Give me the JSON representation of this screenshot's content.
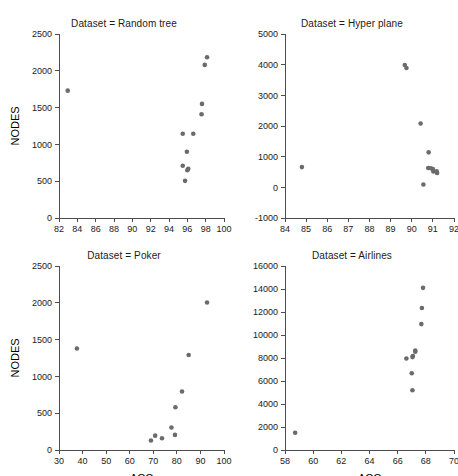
{
  "figure": {
    "background": "#ffffff",
    "marker_color": "#6b6b6b",
    "axis_color": "#4d4d4d",
    "layout": "2x2 grid of scatter panels"
  },
  "chart_data": [
    {
      "type": "scatter",
      "title": "Dataset = Random tree",
      "xlabel": "",
      "ylabel": "NODES",
      "xlim": [
        82,
        100
      ],
      "ylim": [
        0,
        2500
      ],
      "xticks": [
        82,
        84,
        86,
        88,
        90,
        92,
        94,
        96,
        98,
        100
      ],
      "yticks": [
        0,
        500,
        1000,
        1500,
        2000,
        2500
      ],
      "grid": false,
      "legend": "none",
      "points": [
        {
          "x": 82.95,
          "y": 1730
        },
        {
          "x": 95.5,
          "y": 1145
        },
        {
          "x": 95.5,
          "y": 710
        },
        {
          "x": 95.75,
          "y": 505
        },
        {
          "x": 95.95,
          "y": 900
        },
        {
          "x": 96.0,
          "y": 650
        },
        {
          "x": 96.1,
          "y": 670
        },
        {
          "x": 96.65,
          "y": 1145
        },
        {
          "x": 97.55,
          "y": 1410
        },
        {
          "x": 97.6,
          "y": 1550
        },
        {
          "x": 97.9,
          "y": 2080
        },
        {
          "x": 98.15,
          "y": 2185
        }
      ]
    },
    {
      "type": "scatter",
      "title": "Dataset = Hyper plane",
      "xlabel": "",
      "ylabel": "",
      "xlim": [
        84,
        92
      ],
      "ylim": [
        -1000,
        5000
      ],
      "xticks": [
        84,
        85,
        86,
        87,
        88,
        89,
        90,
        91,
        92
      ],
      "yticks": [
        -1000,
        0,
        1000,
        2000,
        3000,
        4000,
        5000
      ],
      "grid": false,
      "legend": "none",
      "points": [
        {
          "x": 84.8,
          "y": 660
        },
        {
          "x": 89.67,
          "y": 3990
        },
        {
          "x": 89.75,
          "y": 3890
        },
        {
          "x": 90.42,
          "y": 2080
        },
        {
          "x": 90.55,
          "y": 90
        },
        {
          "x": 90.8,
          "y": 1140
        },
        {
          "x": 90.78,
          "y": 630
        },
        {
          "x": 90.9,
          "y": 620
        },
        {
          "x": 91.0,
          "y": 600
        },
        {
          "x": 91.02,
          "y": 520
        },
        {
          "x": 91.18,
          "y": 520
        },
        {
          "x": 91.2,
          "y": 470
        }
      ]
    },
    {
      "type": "scatter",
      "title": "Dataset = Poker",
      "xlabel": "ACC",
      "ylabel": "NODES",
      "xlim": [
        30,
        100
      ],
      "ylim": [
        0,
        2500
      ],
      "xticks": [
        30,
        40,
        50,
        60,
        70,
        80,
        90,
        100
      ],
      "yticks": [
        0,
        500,
        1000,
        1500,
        2000,
        2500
      ],
      "grid": false,
      "legend": "none",
      "points": [
        {
          "x": 37.6,
          "y": 1380
        },
        {
          "x": 69.0,
          "y": 130
        },
        {
          "x": 70.8,
          "y": 195
        },
        {
          "x": 73.7,
          "y": 160
        },
        {
          "x": 77.7,
          "y": 305
        },
        {
          "x": 79.2,
          "y": 205
        },
        {
          "x": 79.4,
          "y": 580
        },
        {
          "x": 82.2,
          "y": 795
        },
        {
          "x": 85.0,
          "y": 1290
        },
        {
          "x": 92.8,
          "y": 2005
        }
      ]
    },
    {
      "type": "scatter",
      "title": "Dataset = Airlines",
      "xlabel": "ACC",
      "ylabel": "",
      "xlim": [
        58,
        70
      ],
      "ylim": [
        0,
        16000
      ],
      "xticks": [
        58,
        60,
        62,
        64,
        66,
        68,
        70
      ],
      "yticks": [
        0,
        2000,
        4000,
        6000,
        8000,
        10000,
        12000,
        14000,
        16000
      ],
      "grid": false,
      "legend": "none",
      "points": [
        {
          "x": 58.72,
          "y": 1500
        },
        {
          "x": 66.62,
          "y": 7960
        },
        {
          "x": 67.0,
          "y": 6680
        },
        {
          "x": 67.05,
          "y": 8080
        },
        {
          "x": 67.08,
          "y": 8170
        },
        {
          "x": 67.05,
          "y": 5200
        },
        {
          "x": 67.25,
          "y": 8640
        },
        {
          "x": 67.25,
          "y": 8540
        },
        {
          "x": 67.68,
          "y": 10950
        },
        {
          "x": 67.72,
          "y": 12350
        },
        {
          "x": 67.8,
          "y": 14100
        }
      ]
    }
  ]
}
